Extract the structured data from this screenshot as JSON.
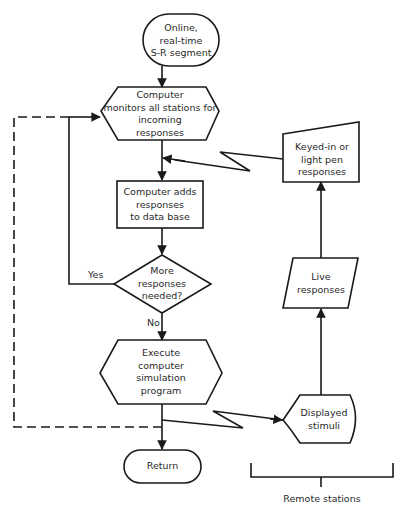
{
  "diagram": {
    "type": "flowchart",
    "colors": {
      "stroke": "#1a1a1a",
      "text": "#2a2a2a",
      "background": "#ffffff"
    },
    "nodes": {
      "start": {
        "shape": "terminator",
        "lines": [
          "Online,",
          "real-time",
          "S-R segment"
        ]
      },
      "monitor": {
        "shape": "preparation-hexagon",
        "lines": [
          "Computer",
          "monitors all stations for",
          "incoming",
          "responses"
        ]
      },
      "add_db": {
        "shape": "process",
        "lines": [
          "Computer adds",
          "responses",
          "to data base"
        ]
      },
      "decision": {
        "shape": "decision",
        "lines": [
          "More",
          "responses",
          "needed?"
        ]
      },
      "execute": {
        "shape": "preparation-hexagon",
        "lines": [
          "Execute",
          "computer",
          "simulation",
          "program"
        ]
      },
      "return": {
        "shape": "terminator",
        "lines": [
          "Return"
        ]
      },
      "keyed_in": {
        "shape": "manual-input",
        "lines": [
          "Keyed-in or",
          "light pen",
          "responses"
        ]
      },
      "live": {
        "shape": "parallelogram-io",
        "lines": [
          "Live",
          "responses"
        ]
      },
      "displayed": {
        "shape": "display",
        "lines": [
          "Displayed",
          "stimuli"
        ]
      }
    },
    "edge_labels": {
      "yes": "Yes",
      "no": "No"
    },
    "group_label": "Remote stations"
  }
}
